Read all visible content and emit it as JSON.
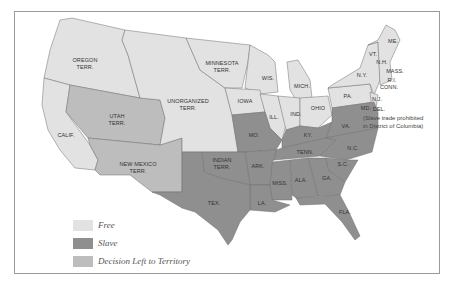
{
  "colors": {
    "free": "#e2e2e2",
    "slave": "#8f8f8f",
    "territory": "#bdbdbd",
    "border": "#6e6e6e",
    "frame": "#9a9a9a"
  },
  "labels": {
    "oregon": "OREGON\nTERR.",
    "minnesota": "MINNESOTA\nTERR.",
    "unorganized": "UNORGANIZED\nTERR.",
    "utah": "UTAH\nTERR.",
    "calif": "CALIF.",
    "new_mexico": "NEW MEXICO\nTERR.",
    "indian": "INDIAN\nTERR.",
    "tex": "TEX.",
    "wis": "WIS.",
    "mich": "MICH.",
    "iowa": "IOWA",
    "ill": "ILL.",
    "ind": "IND.",
    "ohio": "OHIO",
    "mo": "MO.",
    "ky": "KY.",
    "tenn": "TENN.",
    "ark": "ARK.",
    "la": "LA.",
    "miss": "MISS.",
    "ala": "ALA.",
    "ga": "GA.",
    "sc": "S.C.",
    "nc": "N.C.",
    "va": "VA.",
    "fla": "FLA.",
    "md": "MD.",
    "del": "DEL.",
    "nj": "N.J.",
    "pa": "PA.",
    "ny": "N.Y.",
    "vt": "VT.",
    "nh": "N.H.",
    "me": "ME.",
    "mass": "MASS.",
    "ri": "R.I.",
    "conn": "CONN."
  },
  "annotation": {
    "line1": "(Slave trade prohibited",
    "line2": "in District of Columbia)"
  },
  "legend": [
    {
      "label": "Free",
      "color": "#e2e2e2"
    },
    {
      "label": "Slave",
      "color": "#8f8f8f"
    },
    {
      "label": "Decision Left to Territory",
      "color": "#bdbdbd"
    }
  ]
}
